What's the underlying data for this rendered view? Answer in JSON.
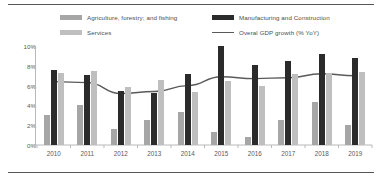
{
  "chart_data": {
    "type": "bar",
    "title": "",
    "subtitle": "",
    "xlabel": "",
    "ylabel": "",
    "categories": [
      "2010",
      "2011",
      "2012",
      "2013",
      "2014",
      "2015",
      "2016",
      "2017",
      "2018",
      "2019"
    ],
    "ylim": [
      0,
      10
    ],
    "ytick_values": [
      0,
      2,
      4,
      6,
      8,
      10
    ],
    "ytick_labels": [
      "0%",
      "2%",
      "4%",
      "6%",
      "8%",
      "10%"
    ],
    "grid": false,
    "legend_position": "top",
    "series": [
      {
        "name": "Agriculture, forestry; and fishing",
        "type": "bar",
        "color": "#a6a6a6",
        "values": [
          3.0,
          4.0,
          1.6,
          2.5,
          3.3,
          1.3,
          0.8,
          2.5,
          4.3,
          2.0
        ]
      },
      {
        "name": "Manufacturing and Construction",
        "type": "bar",
        "color": "#2b2b2b",
        "values": [
          7.6,
          7.1,
          5.5,
          5.3,
          7.2,
          10.0,
          8.1,
          8.5,
          9.2,
          8.8
        ]
      },
      {
        "name": "Services",
        "type": "bar",
        "color": "#bfbfbf",
        "values": [
          7.3,
          7.5,
          5.9,
          6.6,
          5.4,
          6.5,
          6.0,
          7.2,
          7.3,
          7.4
        ]
      },
      {
        "name": "Overal GDP growth (% YoY)",
        "type": "line",
        "color": "#5a5a5a",
        "values": [
          6.4,
          6.3,
          5.2,
          5.4,
          6.0,
          6.9,
          6.7,
          6.8,
          7.2,
          7.0
        ]
      }
    ]
  },
  "legend": {
    "items": [
      {
        "label": "Agriculture, forestry; and fishing",
        "marker": "bar-swatch",
        "color": "#a6a6a6"
      },
      {
        "label": "Services",
        "marker": "bar-swatch",
        "color": "#bfbfbf"
      },
      {
        "label": "Manufacturing and Construction",
        "marker": "bar-swatch",
        "color": "#2b2b2b"
      },
      {
        "label": "Overal GDP growth (% YoY)",
        "marker": "line-swatch",
        "color": "#5a5a5a"
      }
    ]
  }
}
